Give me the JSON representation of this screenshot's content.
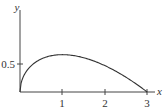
{
  "chart_data": {
    "type": "line",
    "title": "",
    "xlabel": "x",
    "ylabel": "y",
    "xticks": [
      "1",
      "2",
      "3"
    ],
    "yticks": [
      "0.5"
    ],
    "xlim": [
      0,
      3.2
    ],
    "ylim": [
      0,
      1.6
    ],
    "grid": false,
    "legend": null,
    "series": [
      {
        "name": "curve",
        "x": [
          0,
          0.05,
          0.1,
          0.25,
          0.5,
          0.75,
          1.0,
          1.25,
          1.5,
          1.75,
          2.0,
          2.25,
          2.5,
          2.75,
          3.0
        ],
        "y": [
          0,
          0.219,
          0.306,
          0.458,
          0.589,
          0.65,
          0.667,
          0.648,
          0.612,
          0.551,
          0.471,
          0.375,
          0.264,
          0.138,
          0
        ]
      }
    ]
  },
  "labels": {
    "x_axis": "x",
    "y_axis": "y",
    "x_tick_1": "1",
    "x_tick_2": "2",
    "x_tick_3": "3",
    "y_tick_05": "0.5"
  }
}
